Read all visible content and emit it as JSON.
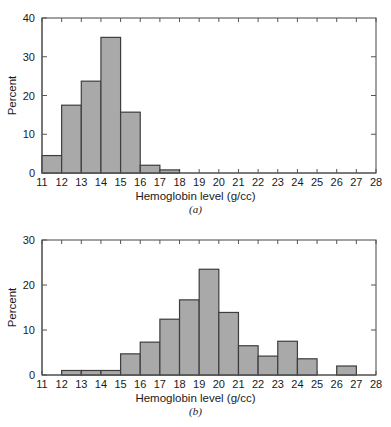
{
  "figure": {
    "background": "#ffffff",
    "bar_fill": "#a9a9a9",
    "bar_stroke": "#3d3d3d",
    "axis_color": "#555555",
    "text_color": "#1a1a1a"
  },
  "panel_a": {
    "caption": "(a)",
    "xlabel": "Hemoglobin level (g/cc)",
    "ylabel": "Percent",
    "ytick_labels": [
      "0",
      "10",
      "20",
      "30",
      "40"
    ],
    "xtick_labels": [
      "11",
      "12",
      "13",
      "14",
      "15",
      "16",
      "17",
      "18",
      "19",
      "20",
      "21",
      "22",
      "23",
      "24",
      "25",
      "26",
      "27",
      "28"
    ]
  },
  "panel_b": {
    "caption": "(b)",
    "xlabel": "Hemoglobin level (g/cc)",
    "ylabel": "Percent",
    "ytick_labels": [
      "0",
      "10",
      "20",
      "30"
    ],
    "xtick_labels": [
      "11",
      "12",
      "13",
      "14",
      "15",
      "16",
      "17",
      "18",
      "19",
      "20",
      "21",
      "22",
      "23",
      "24",
      "25",
      "26",
      "27",
      "28"
    ]
  },
  "chart_data": [
    {
      "type": "bar",
      "id": "panel-a",
      "title": "(a)",
      "xlabel": "Hemoglobin level (g/cc)",
      "ylabel": "Percent",
      "xlim": [
        11,
        28
      ],
      "ylim": [
        0,
        40
      ],
      "xticks": [
        11,
        12,
        13,
        14,
        15,
        16,
        17,
        18,
        19,
        20,
        21,
        22,
        23,
        24,
        25,
        26,
        27,
        28
      ],
      "yticks": [
        0,
        10,
        20,
        30,
        40
      ],
      "grid": false,
      "legend": "none",
      "bin_width": 1,
      "bin_edges": [
        11,
        12,
        13,
        14,
        15,
        16,
        17,
        18
      ],
      "categories": [
        "11-12",
        "12-13",
        "13-14",
        "14-15",
        "15-16",
        "16-17",
        "17-18"
      ],
      "values": [
        4.5,
        17.5,
        23.7,
        35.0,
        15.7,
        2.0,
        0.8
      ]
    },
    {
      "type": "bar",
      "id": "panel-b",
      "title": "(b)",
      "xlabel": "Hemoglobin level (g/cc)",
      "ylabel": "Percent",
      "xlim": [
        11,
        28
      ],
      "ylim": [
        0,
        30
      ],
      "xticks": [
        11,
        12,
        13,
        14,
        15,
        16,
        17,
        18,
        19,
        20,
        21,
        22,
        23,
        24,
        25,
        26,
        27,
        28
      ],
      "yticks": [
        0,
        10,
        20,
        30
      ],
      "grid": false,
      "legend": "none",
      "bin_width": 1,
      "bin_edges": [
        12,
        13,
        14,
        15,
        16,
        17,
        18,
        19,
        20,
        21,
        22,
        23,
        24,
        25,
        26,
        27
      ],
      "categories": [
        "12-13",
        "13-14",
        "14-15",
        "15-16",
        "16-17",
        "17-18",
        "18-19",
        "19-20",
        "20-21",
        "21-22",
        "22-23",
        "23-24",
        "24-25",
        "26-27"
      ],
      "values": [
        1.0,
        1.0,
        1.0,
        4.7,
        7.3,
        12.4,
        16.7,
        23.5,
        13.9,
        6.5,
        4.2,
        7.5,
        3.6,
        2.0
      ],
      "bars": [
        {
          "x0": 12,
          "x1": 13,
          "value": 1.0
        },
        {
          "x0": 13,
          "x1": 14,
          "value": 1.0
        },
        {
          "x0": 14,
          "x1": 15,
          "value": 1.0
        },
        {
          "x0": 15,
          "x1": 16,
          "value": 4.7
        },
        {
          "x0": 16,
          "x1": 17,
          "value": 7.3
        },
        {
          "x0": 17,
          "x1": 18,
          "value": 12.4
        },
        {
          "x0": 18,
          "x1": 19,
          "value": 16.7
        },
        {
          "x0": 19,
          "x1": 20,
          "value": 23.5
        },
        {
          "x0": 20,
          "x1": 21,
          "value": 13.9
        },
        {
          "x0": 21,
          "x1": 22,
          "value": 6.5
        },
        {
          "x0": 22,
          "x1": 23,
          "value": 4.2
        },
        {
          "x0": 23,
          "x1": 24,
          "value": 7.5
        },
        {
          "x0": 24,
          "x1": 25,
          "value": 3.6
        },
        {
          "x0": 26,
          "x1": 27,
          "value": 2.0
        }
      ]
    }
  ]
}
